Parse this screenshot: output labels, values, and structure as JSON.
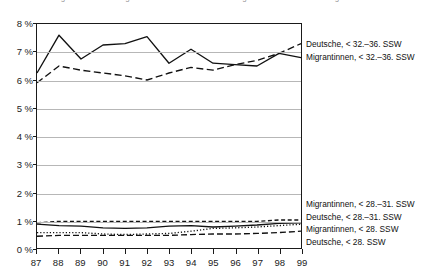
{
  "caption_fragment": "Abbildung: Anteil der Frühgeburten bei Deutschen und Migrantinnen nach Schwangerschaftswoche",
  "axes": {
    "y_ticks": [
      "8 %",
      "7 %",
      "6 %",
      "5 %",
      "4 %",
      "3 %",
      "2 %",
      "1 %",
      "0 %"
    ],
    "x_ticks": [
      "87",
      "88",
      "89",
      "90",
      "91",
      "92",
      "93",
      "94",
      "95",
      "96",
      "97",
      "98",
      "99"
    ]
  },
  "legend_top": [
    "Deutsche, < 32.–36. SSW",
    "Migrantinnen, < 32.–36. SSW"
  ],
  "legend_bottom": [
    "Migrantinnen, < 28.–31. SSW",
    "Deutsche, < 28.–31. SSW",
    "Migrantinnen, < 28. SSW",
    "Deutsche, < 28. SSW"
  ],
  "colors": {
    "line": "#111111",
    "grid": "#b7b7b7",
    "frame": "#1a1a1a",
    "text": "#1a1a1a"
  },
  "chart_data": {
    "type": "line",
    "title": "",
    "xlabel": "",
    "ylabel": "",
    "x": [
      87,
      88,
      89,
      90,
      91,
      92,
      93,
      94,
      95,
      96,
      97,
      98,
      99
    ],
    "xlim": [
      87,
      99
    ],
    "ylim": [
      0,
      8
    ],
    "y_tick_values": [
      0,
      1,
      2,
      3,
      4,
      5,
      6,
      7,
      8
    ],
    "y_unit": "%",
    "grid": true,
    "legend_position": "right",
    "series": [
      {
        "name": "Deutsche, < 32.–36. SSW",
        "style": "solid",
        "values": [
          6.25,
          7.6,
          6.75,
          7.25,
          7.3,
          7.55,
          6.6,
          7.1,
          6.6,
          6.55,
          6.5,
          6.95,
          6.8
        ]
      },
      {
        "name": "Migrantinnen, < 32.–36. SSW",
        "style": "dashed",
        "values": [
          5.9,
          6.5,
          6.35,
          6.25,
          6.15,
          6.0,
          6.25,
          6.45,
          6.35,
          6.55,
          6.7,
          6.95,
          7.3
        ]
      },
      {
        "name": "Migrantinnen, < 28.–31. SSW",
        "style": "dashed-short",
        "values": [
          0.9,
          0.95,
          0.95,
          0.95,
          0.95,
          0.95,
          0.95,
          0.95,
          0.95,
          0.95,
          0.95,
          1.0,
          1.0
        ]
      },
      {
        "name": "Deutsche, < 28.–31. SSW",
        "style": "solid",
        "values": [
          0.85,
          0.8,
          0.78,
          0.72,
          0.7,
          0.72,
          0.78,
          0.8,
          0.75,
          0.78,
          0.82,
          0.88,
          0.9
        ]
      },
      {
        "name": "Migrantinnen, < 28. SSW",
        "style": "dotted",
        "values": [
          0.55,
          0.55,
          0.55,
          0.5,
          0.48,
          0.5,
          0.52,
          0.6,
          0.7,
          0.72,
          0.75,
          0.8,
          0.85
        ]
      },
      {
        "name": "Deutsche, < 28. SSW",
        "style": "dashed-long",
        "values": [
          0.42,
          0.45,
          0.45,
          0.45,
          0.45,
          0.45,
          0.45,
          0.48,
          0.5,
          0.5,
          0.52,
          0.55,
          0.6
        ]
      }
    ]
  }
}
